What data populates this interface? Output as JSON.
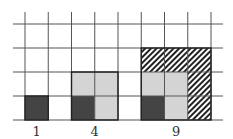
{
  "diagram": {
    "grid": {
      "columns": 8,
      "rows": 4
    },
    "colors": {
      "grid_line": "#555555",
      "dark": "#444444",
      "light": "#d4d4d4",
      "hatch": "#222222"
    },
    "figures": [
      {
        "label": "1",
        "n": 1,
        "start_col": 0,
        "cells": [
          {
            "col": 0,
            "row": 0,
            "fill": "dark"
          }
        ]
      },
      {
        "label": "4",
        "n": 2,
        "start_col": 2,
        "cells": [
          {
            "col": 0,
            "row": 0,
            "fill": "dark"
          },
          {
            "col": 1,
            "row": 0,
            "fill": "light"
          },
          {
            "col": 0,
            "row": 1,
            "fill": "light"
          },
          {
            "col": 1,
            "row": 1,
            "fill": "light"
          }
        ]
      },
      {
        "label": "9",
        "n": 3,
        "start_col": 5,
        "cells": [
          {
            "col": 0,
            "row": 0,
            "fill": "dark"
          },
          {
            "col": 1,
            "row": 0,
            "fill": "light"
          },
          {
            "col": 0,
            "row": 1,
            "fill": "light"
          },
          {
            "col": 1,
            "row": 1,
            "fill": "light"
          },
          {
            "col": 2,
            "row": 0,
            "fill": "hatch"
          },
          {
            "col": 2,
            "row": 1,
            "fill": "hatch"
          },
          {
            "col": 0,
            "row": 2,
            "fill": "hatch"
          },
          {
            "col": 1,
            "row": 2,
            "fill": "hatch"
          },
          {
            "col": 2,
            "row": 2,
            "fill": "hatch"
          }
        ]
      }
    ]
  }
}
